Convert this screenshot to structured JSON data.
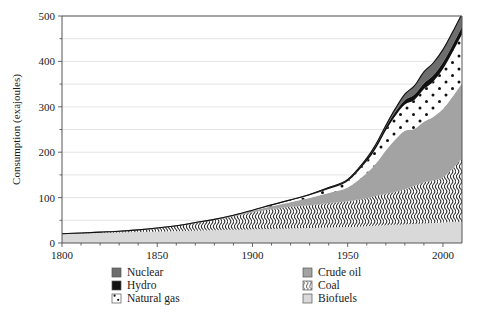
{
  "chart_data": {
    "type": "area",
    "title": "",
    "subtitle": "",
    "xlabel": "",
    "ylabel": "Consumption (exajoules)",
    "xlim": [
      1800,
      2010
    ],
    "ylim": [
      0,
      500
    ],
    "xticks": [
      1800,
      1850,
      1900,
      1950,
      2000
    ],
    "xtick_labels": [
      "1800",
      "1850",
      "1900",
      "1950",
      "2000"
    ],
    "yticks": [
      0,
      100,
      200,
      300,
      400,
      500
    ],
    "ytick_labels": [
      "0",
      "100",
      "200",
      "300",
      "400",
      "500"
    ],
    "gridlines_minor_step": 50,
    "grid": true,
    "legend_position": "below",
    "stacked": true,
    "stack_order_bottom_to_top": [
      "Biofuels",
      "Coal",
      "Crude oil",
      "Natural gas",
      "Hydro",
      "Nuclear"
    ],
    "x": [
      1800,
      1810,
      1820,
      1830,
      1840,
      1850,
      1860,
      1870,
      1880,
      1890,
      1900,
      1910,
      1920,
      1930,
      1940,
      1950,
      1960,
      1965,
      1970,
      1975,
      1980,
      1985,
      1990,
      1995,
      2000,
      2005,
      2010
    ],
    "series": [
      {
        "name": "Biofuels",
        "color": "#d9d9d9",
        "pattern": "solid",
        "values": [
          20,
          21,
          22,
          23,
          24,
          25,
          26,
          27,
          28,
          29,
          30,
          31,
          32,
          33,
          34,
          35,
          37,
          38,
          39,
          40,
          41,
          42,
          43,
          44,
          45,
          46,
          47
        ]
      },
      {
        "name": "Coal",
        "color": "#f2f2f2",
        "pattern": "wavy-vertical-lines",
        "values": [
          0.5,
          1,
          2,
          3,
          5,
          8,
          12,
          17,
          23,
          30,
          38,
          44,
          48,
          50,
          54,
          57,
          62,
          66,
          70,
          73,
          78,
          84,
          91,
          94,
          100,
          118,
          140
        ]
      },
      {
        "name": "Crude oil",
        "color": "#a3a3a3",
        "pattern": "solid",
        "values": [
          0,
          0,
          0,
          0,
          0,
          0,
          0,
          1,
          1,
          2,
          3,
          6,
          10,
          16,
          22,
          30,
          55,
          72,
          95,
          115,
          128,
          125,
          133,
          140,
          150,
          158,
          165
        ]
      },
      {
        "name": "Natural gas",
        "color": "#ffffff",
        "pattern": "dots",
        "values": [
          0,
          0,
          0,
          0,
          0,
          0,
          0,
          0,
          0,
          0,
          1,
          2,
          4,
          6,
          9,
          14,
          26,
          34,
          44,
          52,
          58,
          64,
          72,
          78,
          88,
          98,
          108
        ]
      },
      {
        "name": "Hydro",
        "color": "#111111",
        "pattern": "solid",
        "values": [
          0,
          0,
          0,
          0,
          0,
          0,
          0,
          0,
          0,
          0,
          0,
          1,
          1,
          2,
          3,
          4,
          6,
          7,
          8,
          9,
          10,
          12,
          13,
          14,
          15,
          16,
          17
        ]
      },
      {
        "name": "Nuclear",
        "color": "#6e6e6e",
        "pattern": "solid",
        "values": [
          0,
          0,
          0,
          0,
          0,
          0,
          0,
          0,
          0,
          0,
          0,
          0,
          0,
          0,
          0,
          0,
          1,
          2,
          3,
          7,
          13,
          19,
          25,
          27,
          28,
          28,
          28
        ]
      }
    ],
    "totals": [
      20.5,
      22,
      24,
      26,
      29,
      33,
      38,
      45,
      52,
      61,
      72,
      84,
      95,
      107,
      122,
      140,
      187,
      219,
      259,
      296,
      328,
      346,
      377,
      397,
      426,
      464,
      505
    ]
  },
  "legend": {
    "columns": [
      {
        "items": [
          {
            "label": "Nuclear",
            "swatch": "nuclear-swatch",
            "color": "#6e6e6e",
            "pattern": "solid"
          },
          {
            "label": "Hydro",
            "swatch": "hydro-swatch",
            "color": "#111111",
            "pattern": "solid"
          },
          {
            "label": "Natural gas",
            "swatch": "natural-gas-swatch",
            "color": "#ffffff",
            "pattern": "dots"
          }
        ]
      },
      {
        "items": [
          {
            "label": "Crude oil",
            "swatch": "crude-oil-swatch",
            "color": "#a3a3a3",
            "pattern": "solid"
          },
          {
            "label": "Coal",
            "swatch": "coal-swatch",
            "color": "#f2f2f2",
            "pattern": "wavy-vertical-lines"
          },
          {
            "label": "Biofuels",
            "swatch": "biofuels-swatch",
            "color": "#d9d9d9",
            "pattern": "solid"
          }
        ]
      }
    ]
  }
}
